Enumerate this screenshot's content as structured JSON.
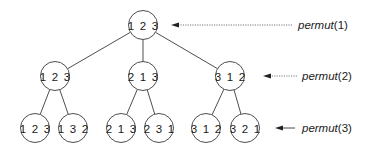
{
  "diagram": {
    "title": "",
    "nodes": [
      {
        "id": "root",
        "label": "1 2 3",
        "cx": 143,
        "cy": 25
      },
      {
        "id": "l2a",
        "label": "1 2 3",
        "cx": 55,
        "cy": 76
      },
      {
        "id": "l2b",
        "label": "2 1 3",
        "cx": 143,
        "cy": 76
      },
      {
        "id": "l2c",
        "label": "3 1 2",
        "cx": 230,
        "cy": 76
      },
      {
        "id": "l3a",
        "label": "1 2 3",
        "cx": 35,
        "cy": 128
      },
      {
        "id": "l3b",
        "label": "1 3 2",
        "cx": 73,
        "cy": 128
      },
      {
        "id": "l3c",
        "label": "2 1 3",
        "cx": 121,
        "cy": 128
      },
      {
        "id": "l3d",
        "label": "2 3 1",
        "cx": 159,
        "cy": 128
      },
      {
        "id": "l3e",
        "label": "3 1 2",
        "cx": 206,
        "cy": 128
      },
      {
        "id": "l3f",
        "label": "3 2 1",
        "cx": 245,
        "cy": 128
      }
    ],
    "edges": [
      {
        "from": "root",
        "to": "l2a"
      },
      {
        "from": "root",
        "to": "l2b"
      },
      {
        "from": "root",
        "to": "l2c"
      },
      {
        "from": "l2a",
        "to": "l3a"
      },
      {
        "from": "l2a",
        "to": "l3b"
      },
      {
        "from": "l2b",
        "to": "l3c"
      },
      {
        "from": "l2b",
        "to": "l3d"
      },
      {
        "from": "l2c",
        "to": "l3e"
      },
      {
        "from": "l2c",
        "to": "l3f"
      }
    ],
    "node_radius": 14.5,
    "levels": [
      {
        "fn": "permut",
        "arg": "(1)",
        "y": 25,
        "arrow_from": 292,
        "arrow_to": 172,
        "style": "dotted",
        "label_x": 298
      },
      {
        "fn": "permut",
        "arg": "(2)",
        "y": 76,
        "arrow_from": 297,
        "arrow_to": 264,
        "style": "dotted",
        "label_x": 302
      },
      {
        "fn": "permut",
        "arg": "(3)",
        "y": 128,
        "arrow_from": 295,
        "arrow_to": 276,
        "style": "solid",
        "label_x": 302
      }
    ]
  },
  "labels": {
    "level1_fn": "permut",
    "level1_arg": "(1)",
    "level2_fn": "permut",
    "level2_arg": "(2)",
    "level3_fn": "permut",
    "level3_arg": "(3)",
    "root": "1 2 3",
    "l2a": "1 2 3",
    "l2b": "2 1 3",
    "l2c": "3 1 2",
    "l3a": "1 2 3",
    "l3b": "1 3 2",
    "l3c": "2 1 3",
    "l3d": "2 3 1",
    "l3e": "3 1 2",
    "l3f": "3 2 1"
  },
  "colors": {
    "stroke": "#3a3a3a",
    "text": "#1a1a1a",
    "background": "#ffffff"
  }
}
